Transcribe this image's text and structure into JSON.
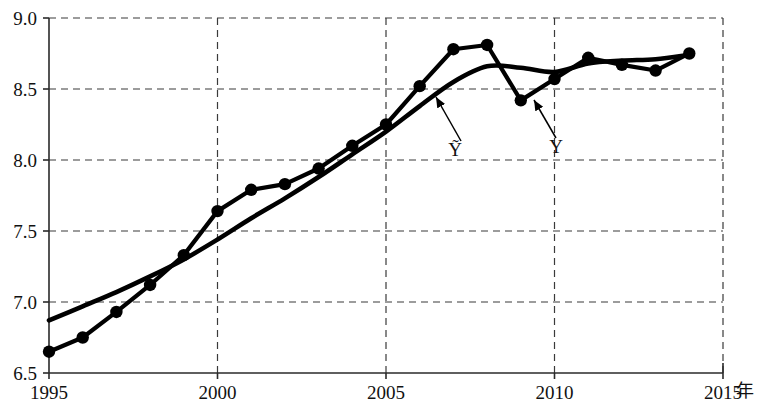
{
  "chart_data": {
    "type": "line",
    "title": "",
    "subtitle": "",
    "xlabel": "年",
    "ylabel": "",
    "xlim": [
      1995,
      2015
    ],
    "ylim": [
      6.5,
      9.0
    ],
    "grid": true,
    "legend_position": "inline-annotation",
    "x_tick_labels": [
      "1995",
      "2000",
      "2005",
      "2010",
      "2015"
    ],
    "x_tick_values": [
      1995,
      2000,
      2005,
      2010,
      2015
    ],
    "y_tick_labels": [
      "6.5",
      "7.0",
      "7.5",
      "8.0",
      "8.5",
      "9.0"
    ],
    "y_tick_values": [
      6.5,
      7.0,
      7.5,
      8.0,
      8.5,
      9.0
    ],
    "x": [
      1995,
      1996,
      1997,
      1998,
      1999,
      2000,
      2001,
      2002,
      2003,
      2004,
      2005,
      2006,
      2007,
      2008,
      2009,
      2010,
      2011,
      2012,
      2013,
      2014
    ],
    "series": [
      {
        "name": "Y",
        "label": "Y",
        "marker": "filled-circle",
        "values": [
          6.65,
          6.75,
          6.93,
          7.12,
          7.33,
          7.64,
          7.79,
          7.83,
          7.94,
          8.1,
          8.25,
          8.52,
          8.78,
          8.81,
          8.42,
          8.57,
          8.72,
          8.67,
          8.63,
          8.75
        ]
      },
      {
        "name": "Ytilde",
        "label": "Ỹ",
        "marker": "none",
        "values": [
          6.87,
          6.97,
          7.07,
          7.18,
          7.3,
          7.44,
          7.59,
          7.73,
          7.88,
          8.04,
          8.2,
          8.38,
          8.55,
          8.66,
          8.65,
          8.62,
          8.68,
          8.7,
          8.71,
          8.74
        ]
      }
    ],
    "annotations": [
      {
        "name": "smooth-series-annotation",
        "text": "Ỹ",
        "text_x": 455,
        "text_y": 156,
        "arrow_from_x": 461,
        "arrow_from_y": 141,
        "arrow_to_x": 436,
        "arrow_to_y": 97
      },
      {
        "name": "observed-series-annotation",
        "text": "Y",
        "text_x": 556,
        "text_y": 153,
        "arrow_from_x": 556,
        "arrow_from_y": 138,
        "arrow_to_x": 534,
        "arrow_to_y": 100
      }
    ]
  },
  "colors": {
    "line": "#000000",
    "axis": "#2a2a2a",
    "grid": "#3a3a3a",
    "background": "#ffffff"
  }
}
